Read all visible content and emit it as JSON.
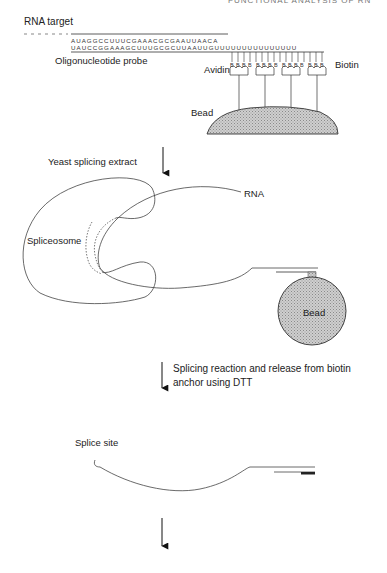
{
  "header": {
    "running_title": "FUNCTIONAL ANALYSIS OF RN"
  },
  "step1": {
    "rna_target_label": "RNA target",
    "target_sequence": "AUAGGCCUUUCGAAACGCGAAUUAACA",
    "probe_sequence": "UAUCCGGAAAGCUUUGCGCUUAAUUGUUUUUUUUUUUUUUU",
    "probe_label": "Oligonucleotide probe",
    "avidin_label": "Avidin",
    "biotin_label": "Biotin",
    "bead_label": "Bead",
    "biotin_glyph": "B"
  },
  "arrow1": {
    "label": "Yeast splicing extract"
  },
  "step2": {
    "rna_label": "RNA",
    "spliceosome_label": "Spliceosome",
    "bead_label": "Bead"
  },
  "arrow2": {
    "label_line1": "Splicing reaction and release from biotin",
    "label_line2": "anchor using DTT"
  },
  "step3": {
    "splice_site_label": "Splice site"
  },
  "colors": {
    "line": "#333333",
    "bead_fill": "#bdbdbd",
    "text": "#222222"
  }
}
